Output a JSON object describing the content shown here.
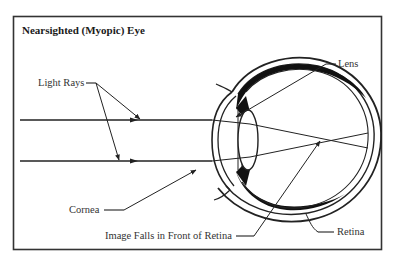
{
  "title": "Nearsighted (Myopic) Eye",
  "labels": {
    "light_rays": "Light Rays",
    "lens": "Lens",
    "cornea": "Cornea",
    "image_falls": "Image Falls in Front of Retina",
    "retina": "Retina"
  },
  "colors": {
    "stroke": "#222222",
    "text": "#333333",
    "background": "#ffffff"
  }
}
